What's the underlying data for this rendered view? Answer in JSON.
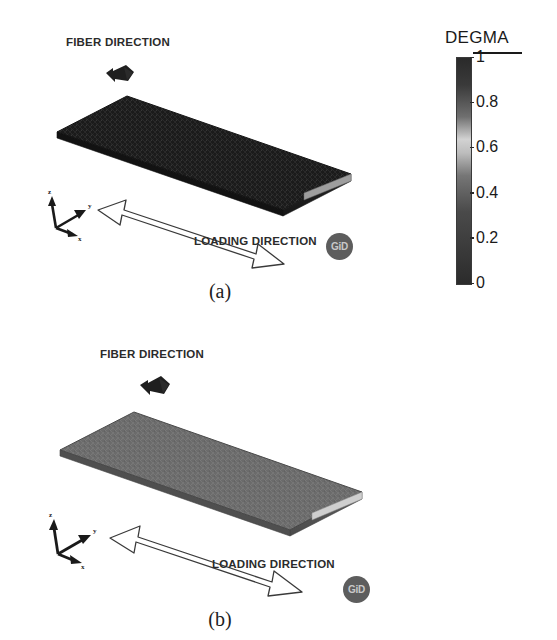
{
  "figure": {
    "background_color": "#ffffff",
    "width": 557,
    "height": 640
  },
  "colorbar": {
    "title": "DEGMA",
    "min": 0,
    "max": 1,
    "ticks": [
      {
        "value": 1,
        "label": "1",
        "pos_pct": 0
      },
      {
        "value": 0.8,
        "label": "0.8",
        "pos_pct": 20
      },
      {
        "value": 0.6,
        "label": "0.6",
        "pos_pct": 40
      },
      {
        "value": 0.4,
        "label": "0.4",
        "pos_pct": 60
      },
      {
        "value": 0.2,
        "label": "0.2",
        "pos_pct": 80
      },
      {
        "value": 0,
        "label": "0",
        "pos_pct": 100
      }
    ],
    "gradient_stops": [
      {
        "pos_pct": 0,
        "color": "#2a2a2a"
      },
      {
        "pos_pct": 12,
        "color": "#3a3a3a"
      },
      {
        "pos_pct": 26,
        "color": "#6f6f6f"
      },
      {
        "pos_pct": 36,
        "color": "#d2d2d2"
      },
      {
        "pos_pct": 42,
        "color": "#bdbdbd"
      },
      {
        "pos_pct": 52,
        "color": "#767676"
      },
      {
        "pos_pct": 68,
        "color": "#4a4a4a"
      },
      {
        "pos_pct": 84,
        "color": "#3b3b3b"
      },
      {
        "pos_pct": 100,
        "color": "#2b2b2b"
      }
    ]
  },
  "panels": [
    {
      "id": "a",
      "caption": "(a)",
      "fiber_label": "FIBER DIRECTION",
      "loading_label": "LOADING DIRECTION",
      "gid_label": "GiD",
      "axes": {
        "x": "x",
        "y": "y",
        "z": "z"
      },
      "plate": {
        "top_face_color": "#1c1c1c",
        "side_face_color": "#242424",
        "front_edge_color": "#9a9a9a",
        "degma_value": 1.0,
        "description": "fully degraded matrix plate, dark mesh texture"
      }
    },
    {
      "id": "b",
      "caption": "(b)",
      "fiber_label": "FIBER DIRECTION",
      "loading_label": "LOADING DIRECTION",
      "gid_label": "GiD",
      "axes": {
        "x": "x",
        "y": "y",
        "z": "z"
      },
      "plate": {
        "top_face_color": "#6b6b6b",
        "side_face_color": "#5a5a5a",
        "front_edge_color": "#d0d0d0",
        "degma_value": 0.45,
        "description": "partially degraded matrix plate, mid gray"
      }
    }
  ]
}
